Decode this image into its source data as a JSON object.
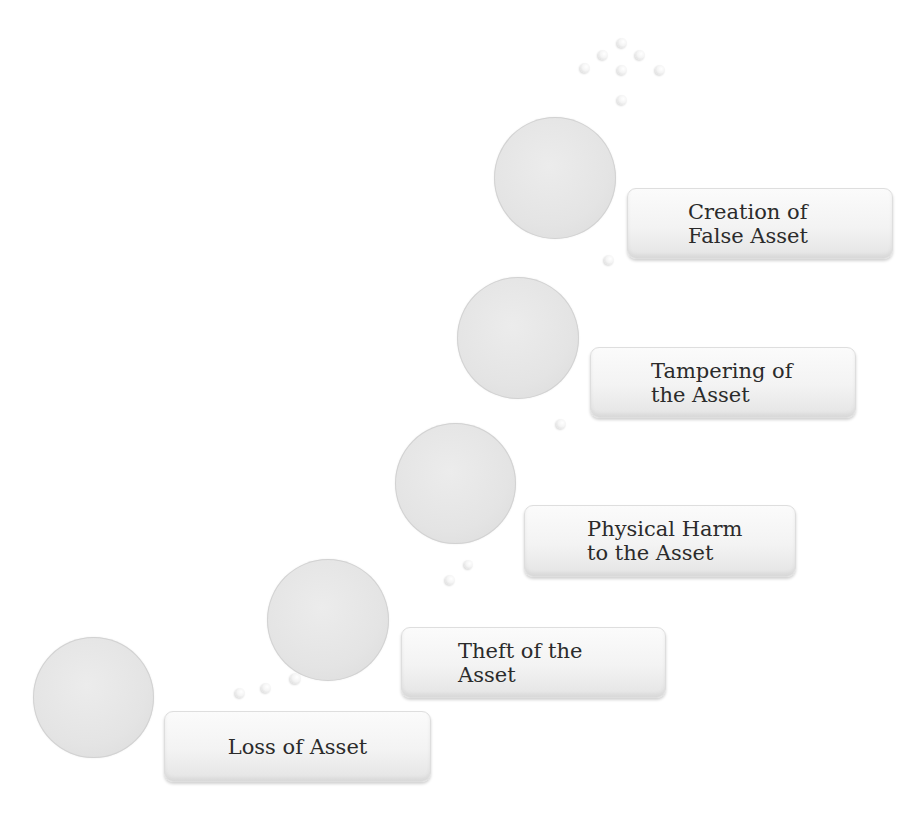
{
  "diagram": {
    "type": "ascending-staircase",
    "steps": [
      {
        "label": "Loss of Asset",
        "circle": {
          "x": 33,
          "y": 637,
          "d": 121
        },
        "box": {
          "x": 164,
          "y": 711,
          "w": 267,
          "h": 71,
          "pad": 66,
          "align": "center"
        }
      },
      {
        "label": "Theft of the\nAsset",
        "circle": {
          "x": 267,
          "y": 559,
          "d": 122
        },
        "box": {
          "x": 401,
          "y": 627,
          "w": 265,
          "h": 71,
          "pad": 56,
          "align": "left"
        }
      },
      {
        "label": "Physical Harm\nto the Asset",
        "circle": {
          "x": 395,
          "y": 423,
          "d": 121
        },
        "box": {
          "x": 524,
          "y": 505,
          "w": 272,
          "h": 72,
          "pad": 62,
          "align": "left"
        }
      },
      {
        "label": "Tampering of\nthe Asset",
        "circle": {
          "x": 457,
          "y": 277,
          "d": 122
        },
        "box": {
          "x": 590,
          "y": 347,
          "w": 266,
          "h": 71,
          "pad": 60,
          "align": "left"
        }
      },
      {
        "label": "Creation of\nFalse Asset",
        "circle": {
          "x": 494,
          "y": 117,
          "d": 122
        },
        "box": {
          "x": 627,
          "y": 188,
          "w": 266,
          "h": 71,
          "pad": 60,
          "align": "left"
        }
      }
    ],
    "connector_bubbles": [
      {
        "x": 240,
        "y": 693,
        "d": 10
      },
      {
        "x": 266,
        "y": 688,
        "d": 10
      },
      {
        "x": 295,
        "y": 678,
        "d": 11
      },
      {
        "x": 450,
        "y": 580,
        "d": 10
      },
      {
        "x": 468,
        "y": 564,
        "d": 9
      },
      {
        "x": 561,
        "y": 424,
        "d": 10
      },
      {
        "x": 609,
        "y": 260,
        "d": 10
      }
    ],
    "top_cluster_bubbles": [
      {
        "x": 622,
        "y": 43,
        "d": 10
      },
      {
        "x": 603,
        "y": 55,
        "d": 10
      },
      {
        "x": 640,
        "y": 55,
        "d": 10
      },
      {
        "x": 585,
        "y": 68,
        "d": 10
      },
      {
        "x": 622,
        "y": 70,
        "d": 10
      },
      {
        "x": 660,
        "y": 70,
        "d": 10
      },
      {
        "x": 622,
        "y": 100,
        "d": 10
      }
    ],
    "colors": {
      "circle_fill": "#e4e4e4",
      "box_fill": "#f3f3f3",
      "text": "#2b2b2b",
      "background": "#ffffff"
    }
  }
}
